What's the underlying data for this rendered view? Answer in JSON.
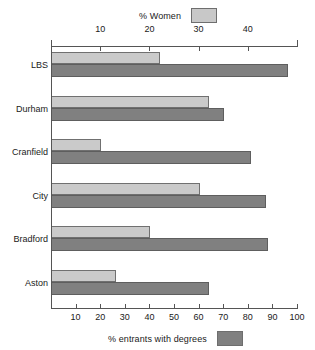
{
  "chart_data": {
    "type": "bar",
    "orientation": "horizontal",
    "title": "",
    "categories": [
      "LBS",
      "Durham",
      "Cranfield",
      "City",
      "Bradford",
      "Aston"
    ],
    "series": [
      {
        "name": "% Women",
        "axis": "top",
        "color": "#cacaca",
        "values": [
          22,
          32,
          10,
          30,
          20,
          13
        ]
      },
      {
        "name": "% entrants with degrees",
        "axis": "bottom",
        "color": "#808080",
        "values": [
          96,
          70,
          81,
          87,
          88,
          64
        ]
      }
    ],
    "axes": {
      "top": {
        "label": "% Women",
        "min": 0,
        "max": 50,
        "ticks": [
          10,
          20,
          30,
          40
        ],
        "tick_labels": [
          "10",
          "20",
          "30",
          "40"
        ]
      },
      "bottom": {
        "label": "% entrants with degrees",
        "min": 0,
        "max": 100,
        "ticks": [
          10,
          20,
          30,
          40,
          50,
          60,
          70,
          80,
          90,
          100
        ],
        "tick_labels": [
          "10",
          "20",
          "30",
          "40",
          "50",
          "60",
          "70",
          "80",
          "90",
          "100"
        ]
      }
    },
    "grid": false,
    "legend_top": {
      "label": "% Women",
      "swatch_color": "#c8c8c8",
      "position": "top-center"
    },
    "legend_bottom": {
      "label": "% entrants with degrees",
      "swatch_color": "#808080",
      "position": "bottom-center"
    }
  },
  "colors": {
    "light_bar": "#cacaca",
    "dark_bar": "#808080",
    "axis": "#555555",
    "text": "#1a1a1a",
    "background": "#ffffff"
  }
}
